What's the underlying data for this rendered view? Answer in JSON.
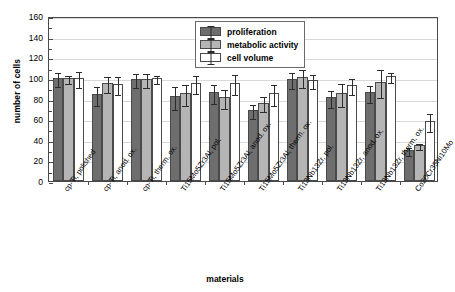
{
  "chart_data": {
    "type": "bar",
    "title": "",
    "xlabel": "materials",
    "ylabel": "number of cells",
    "ylim": [
      0,
      160
    ],
    "ytick_step": 20,
    "yticks": [
      0,
      20,
      40,
      60,
      80,
      100,
      120,
      140,
      160
    ],
    "grid": true,
    "legend_position": "top-center",
    "categories": [
      "cp-Ti, polished",
      "cp-Ti, anod. ox.",
      "cp-Ti, therm. ox.",
      "Ti15Mo5Zr3Al, pol.",
      "Ti15Mo5Zr3Al, anod. ox.",
      "Ti15Mo5Zr3Al, therm. ox.",
      "Ti13Nb13Zr, pol.",
      "Ti13Nb13Zr, anod. ox.",
      "Ti13Nb13Zr, therm. ox.",
      "Co20Cr35Ni10Mo"
    ],
    "series": [
      {
        "name": "proliferation",
        "color": "#6e6e6e",
        "values": [
          100,
          84,
          99,
          82,
          86,
          69,
          99,
          81,
          86,
          30
        ],
        "errors": [
          7,
          9,
          7,
          11,
          9,
          7,
          8,
          8,
          8,
          4
        ]
      },
      {
        "name": "metabolic activity",
        "color": "#b5b5b5",
        "values": [
          100,
          95,
          99,
          85,
          81,
          76,
          101,
          85,
          96,
          35
        ],
        "errors": [
          4,
          8,
          7,
          10,
          9,
          7,
          9,
          11,
          14,
          3
        ]
      },
      {
        "name": "cell volume",
        "color": "#ffffff",
        "values": [
          100,
          94,
          100,
          95,
          95,
          85,
          98,
          93,
          102,
          58
        ],
        "errors": [
          8,
          9,
          4,
          9,
          10,
          10,
          7,
          8,
          5,
          9
        ]
      }
    ]
  },
  "axis": {
    "ylabel": "number of cells",
    "xlabel": "materials"
  },
  "legend": {
    "items": [
      {
        "label": "proliferation"
      },
      {
        "label": "metabolic activity"
      },
      {
        "label": "cell volume"
      }
    ]
  }
}
